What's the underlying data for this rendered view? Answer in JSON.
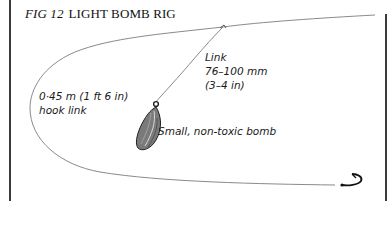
{
  "figure": {
    "number": "FIG 12",
    "title": "LIGHT BOMB RIG"
  },
  "labels": {
    "link": [
      "Link",
      "76–100 mm",
      "(3–4 in)"
    ],
    "hook_link": [
      "0·45 m (1 ft 6 in)",
      "hook link"
    ],
    "bomb": "Small, non-toxic bomb"
  },
  "colors": {
    "line": "#8a8a8a",
    "border": "#3a3a3a",
    "text": "#1a1a1a",
    "bomb_fill": "#6e6e6e"
  }
}
